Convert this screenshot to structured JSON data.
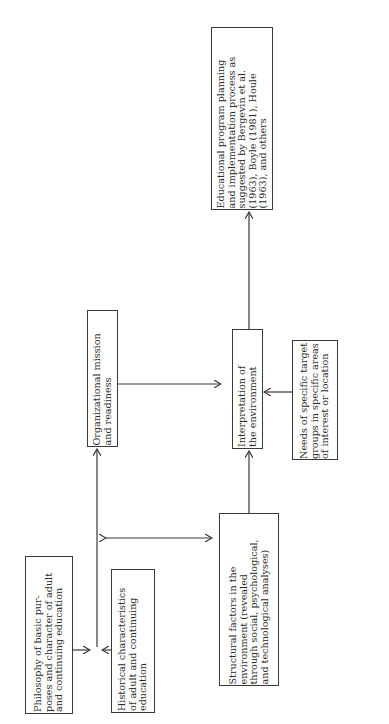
{
  "diagram": {
    "orientation": "rotated -90deg (reads bottom-to-top)",
    "nodes": [
      {
        "id": "philosophy",
        "text": "Philosophy of basic pur-\nposes and character of adult\nand continuing education"
      },
      {
        "id": "historical",
        "text": "Historical characteristics\nof adult and continuing\neducation"
      },
      {
        "id": "organizational",
        "text": "Organizational mission\nand readiness"
      },
      {
        "id": "structural",
        "text": "Structural factors in the\nenvironment (revealed\nthrough social, psychological,\nand technological analyses)"
      },
      {
        "id": "interpretation",
        "text": "Interpretation of\nthe environment"
      },
      {
        "id": "needs",
        "text": "Needs of specific target\ngroups in specific areas\nof interest or location"
      },
      {
        "id": "educational",
        "text": "Educational program planning\nand implementation process as\nsuggested by Bergevin et al.\n(1963), Boyle (1981), Houle\n(1963), and others"
      }
    ],
    "edges": [
      {
        "from": "philosophy",
        "to": "organizational",
        "note": "merges with historical at junction"
      },
      {
        "from": "historical",
        "to": "organizational",
        "note": "merges with philosophy at junction"
      },
      {
        "from": "organizational",
        "to": "interpretation"
      },
      {
        "from": "organizational",
        "to": "structural",
        "bidirectional": true
      },
      {
        "from": "structural",
        "to": "interpretation"
      },
      {
        "from": "needs",
        "to": "interpretation"
      },
      {
        "from": "interpretation",
        "to": "educational"
      }
    ],
    "colors": {
      "line": "#3a3a3a",
      "text": "#2a2a2a",
      "background": "#ffffff"
    }
  }
}
